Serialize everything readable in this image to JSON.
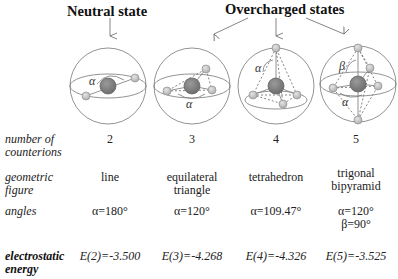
{
  "headers": {
    "neutral": "Neutral state",
    "overcharged": "Overcharged states"
  },
  "row_labels": {
    "counterions": [
      "number of",
      "counterions"
    ],
    "figure": [
      "geometric",
      "figure"
    ],
    "angles": "angles",
    "energy": [
      "electrostatic",
      "energy"
    ]
  },
  "columns": [
    {
      "n": "2",
      "figure": [
        "line"
      ],
      "angles": [
        "α=180°"
      ],
      "energy": "E(2)=-3.500",
      "angle_symbols": [
        "α"
      ]
    },
    {
      "n": "3",
      "figure": [
        "equilateral",
        "triangle"
      ],
      "angles": [
        "α=120°"
      ],
      "energy": "E(3)=-4.268",
      "angle_symbols": [
        "α"
      ]
    },
    {
      "n": "4",
      "figure": [
        "tetrahedron"
      ],
      "angles": [
        "α=109.47°"
      ],
      "energy": "E(4)=-4.326",
      "angle_symbols": [
        "α"
      ]
    },
    {
      "n": "5",
      "figure": [
        "trigonal",
        "bipyramid"
      ],
      "angles": [
        "α=120°",
        "β=90°"
      ],
      "energy": "E(5)=-3.525",
      "angle_symbols": [
        "β",
        "α"
      ]
    }
  ],
  "colors": {
    "sphere_outline": "#777777",
    "central_ion": "#808080",
    "counterion": "#c8c8c8",
    "dashed": "#666666"
  }
}
